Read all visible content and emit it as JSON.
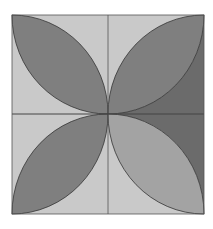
{
  "diagram": {
    "type": "geometric-figure",
    "square": {
      "x": 12,
      "y": 15,
      "w": 192,
      "h": 199
    },
    "center": {
      "x": 108,
      "y": 114
    },
    "colors": {
      "background": "#ffffff",
      "light_fill": "#c9c9c9",
      "dark_corner_fill": "#6b6b6b",
      "petal_fill": "#7f7f7f",
      "petal_light_fill": "#a3a3a3",
      "stroke": "#333333",
      "grid_line": "#555555"
    },
    "quadrants": [
      {
        "name": "top-left",
        "petal": "dark",
        "background": "light"
      },
      {
        "name": "top-right",
        "petal": "dark",
        "background": "light-top-left / dark-bottom-right"
      },
      {
        "name": "bottom-left",
        "petal": "dark",
        "background": "light"
      },
      {
        "name": "bottom-right",
        "petal": "light",
        "background": "light-bottom-left / dark-top-right"
      }
    ]
  }
}
